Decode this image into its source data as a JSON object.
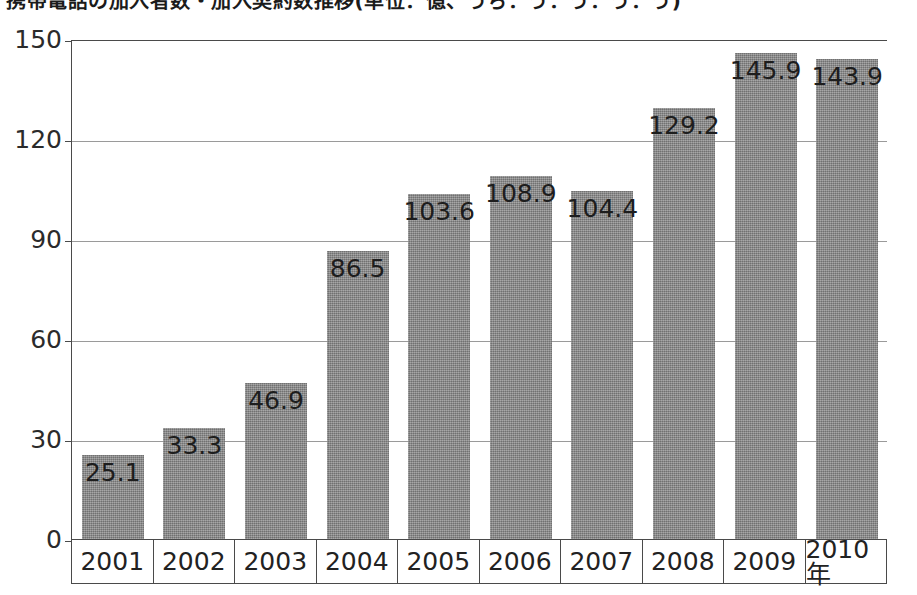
{
  "chart_data": {
    "type": "bar",
    "title": "携帯電話の加入者数・加入契約数推移(単位：億、うち：う：う：う：う)",
    "xlabel": "",
    "ylabel": "",
    "categories": [
      "2001",
      "2002",
      "2003",
      "2004",
      "2005",
      "2006",
      "2007",
      "2008",
      "2009",
      "2010年"
    ],
    "values": [
      25.1,
      33.3,
      46.9,
      86.5,
      103.6,
      108.9,
      104.4,
      129.2,
      145.9,
      143.9
    ],
    "value_labels": [
      "25.1",
      "33.3",
      "46.9",
      "86.5",
      "103.6",
      "108.9",
      "104.4",
      "129.2",
      "145.9",
      "143.9"
    ],
    "ylim": [
      0,
      150
    ],
    "yticks": [
      0,
      30,
      60,
      90,
      120,
      150
    ],
    "ytick_labels": [
      "0",
      "30",
      "60",
      "90",
      "120",
      "150"
    ],
    "grid": true,
    "legend": null,
    "bar_color": "#8a8a8a",
    "axis_color": "#4a4a4a",
    "gridline_color": "#9a9a9a",
    "text_color": "#1d1d1d"
  }
}
